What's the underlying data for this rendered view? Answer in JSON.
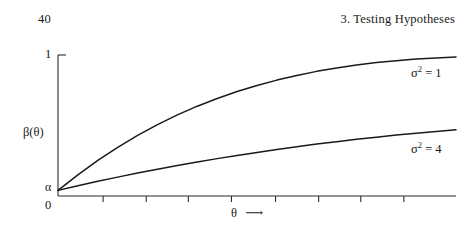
{
  "header": {
    "page_number": "40",
    "chapter_title": "3.  Testing Hypotheses"
  },
  "chart_data": {
    "type": "line",
    "title": "",
    "xlabel": "θ",
    "xlabel_arrow": "⟶",
    "ylabel": "β(θ)",
    "xlim": [
      0,
      1
    ],
    "ylim": [
      0,
      1
    ],
    "grid": false,
    "legend_position": "right-inline",
    "y_tick_labels": [
      "0",
      "1"
    ],
    "y_annotation_label": "α",
    "y_annotation_value": 0.04,
    "x_tick_count": 8,
    "x_tick_positions": [
      0.1133,
      0.2217,
      0.3275,
      0.4358,
      0.5466,
      0.6549,
      0.7607,
      0.869
    ],
    "x_tick_labels": [
      "",
      "",
      "",
      "",
      "",
      "",
      "",
      ""
    ],
    "series": [
      {
        "name": "σ² = 1",
        "label_sigma": "σ",
        "label_exponent": "2",
        "label_equals": " = ",
        "label_value": "1",
        "x": [
          0.0,
          0.05,
          0.1,
          0.15,
          0.2,
          0.25,
          0.3,
          0.35,
          0.4,
          0.45,
          0.5,
          0.55,
          0.6,
          0.65,
          0.7,
          0.75,
          0.8,
          0.85,
          0.9,
          0.95,
          1.0
        ],
        "y": [
          0.04,
          0.15,
          0.252,
          0.345,
          0.43,
          0.506,
          0.575,
          0.637,
          0.692,
          0.741,
          0.784,
          0.822,
          0.855,
          0.884,
          0.908,
          0.929,
          0.946,
          0.96,
          0.971,
          0.979,
          0.985
        ]
      },
      {
        "name": "σ² = 4",
        "label_sigma": "σ",
        "label_exponent": "2",
        "label_equals": " = ",
        "label_value": "4",
        "x": [
          0.0,
          0.05,
          0.1,
          0.15,
          0.2,
          0.25,
          0.3,
          0.35,
          0.4,
          0.45,
          0.5,
          0.55,
          0.6,
          0.65,
          0.7,
          0.75,
          0.8,
          0.85,
          0.9,
          0.95,
          1.0
        ],
        "y": [
          0.04,
          0.073,
          0.104,
          0.134,
          0.163,
          0.19,
          0.216,
          0.241,
          0.265,
          0.288,
          0.309,
          0.33,
          0.349,
          0.368,
          0.385,
          0.402,
          0.417,
          0.432,
          0.445,
          0.458,
          0.47
        ]
      }
    ],
    "line_color": "#1a1a1a",
    "axis_color": "#2b2b2b"
  }
}
